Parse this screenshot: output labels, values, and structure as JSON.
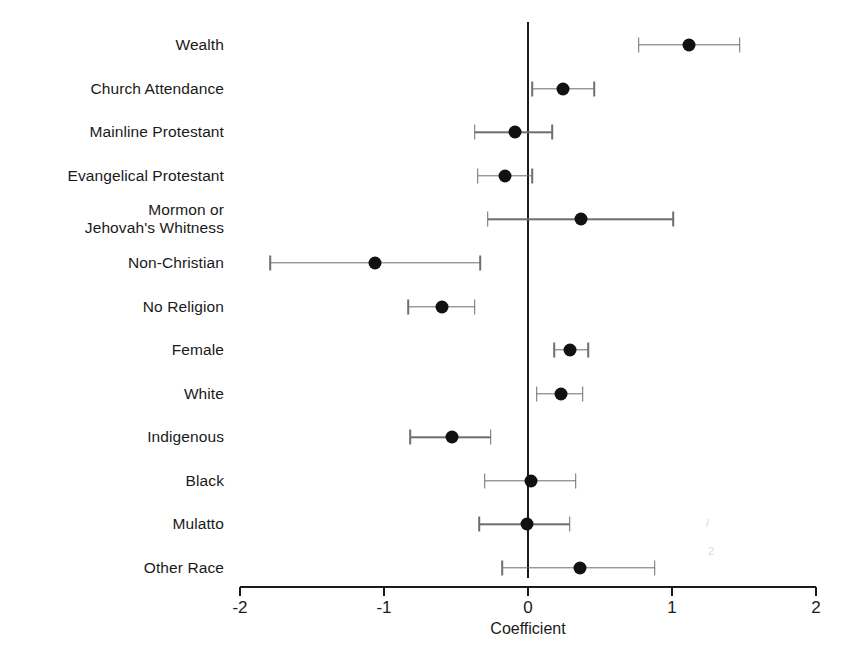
{
  "chart_data": {
    "type": "scatter",
    "title": "",
    "subtitle": "",
    "xlabel": "Coefficient",
    "ylabel": "",
    "xlim": [
      -2,
      2
    ],
    "xticks": [
      -2,
      -1,
      0,
      1,
      2
    ],
    "xtick_labels": [
      "-2",
      "-1",
      "0",
      "1",
      "2"
    ],
    "grid": false,
    "legend": null,
    "reference_line": 0,
    "orientation": "horizontal",
    "error_bar_type": "confidence-interval",
    "categories": [
      "Wealth",
      "Church Attendance",
      "Mainline Protestant",
      "Evangelical Protestant",
      "Mormon or\nJehovah's Whitness",
      "Non-Christian",
      "No Religion",
      "Female",
      "White",
      "Indigenous",
      "Black",
      "Mulatto",
      "Other Race"
    ],
    "points": [
      {
        "label": "Wealth",
        "value": 1.12,
        "ci_low": 0.77,
        "ci_high": 1.47
      },
      {
        "label": "Church Attendance",
        "value": 0.24,
        "ci_low": 0.03,
        "ci_high": 0.46
      },
      {
        "label": "Mainline Protestant",
        "value": -0.09,
        "ci_low": -0.37,
        "ci_high": 0.17
      },
      {
        "label": "Evangelical Protestant",
        "value": -0.16,
        "ci_low": -0.35,
        "ci_high": 0.03
      },
      {
        "label": "Mormon or Jehovah's Whitness",
        "value": 0.37,
        "ci_low": -0.28,
        "ci_high": 1.01
      },
      {
        "label": "Non-Christian",
        "value": -1.06,
        "ci_low": -1.79,
        "ci_high": -0.33
      },
      {
        "label": "No Religion",
        "value": -0.6,
        "ci_low": -0.83,
        "ci_high": -0.37
      },
      {
        "label": "Female",
        "value": 0.29,
        "ci_low": 0.18,
        "ci_high": 0.42
      },
      {
        "label": "White",
        "value": 0.23,
        "ci_low": 0.06,
        "ci_high": 0.38
      },
      {
        "label": "Indigenous",
        "value": -0.53,
        "ci_low": -0.82,
        "ci_high": -0.26
      },
      {
        "label": "Black",
        "value": 0.02,
        "ci_low": -0.3,
        "ci_high": 0.33
      },
      {
        "label": "Mulatto",
        "value": -0.01,
        "ci_low": -0.34,
        "ci_high": 0.29
      },
      {
        "label": "Other Race",
        "value": 0.36,
        "ci_low": -0.18,
        "ci_high": 0.88
      }
    ],
    "colors": {
      "point": "#111111",
      "whisker": "#6e6e6e",
      "axis": "#1a1a1a",
      "background": "#ffffff"
    }
  }
}
